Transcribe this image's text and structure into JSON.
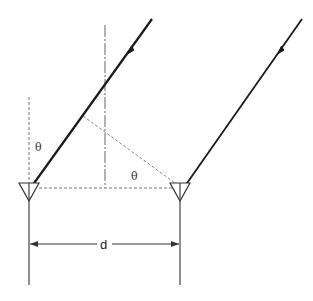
{
  "diagram": {
    "labels": {
      "theta_left": "θ",
      "theta_right": "θ",
      "spacing": "d"
    },
    "colors": {
      "ray": "#1a1a1a",
      "construction": "#666666",
      "element": "#333333",
      "background": "#ffffff"
    }
  }
}
